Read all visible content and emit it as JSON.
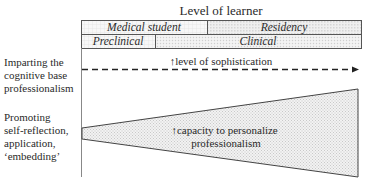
{
  "title": "Level of learner",
  "header": {
    "row1": [
      {
        "label": "Medical student"
      },
      {
        "label": "Residency"
      }
    ],
    "row2": [
      {
        "label": "Preclinical"
      },
      {
        "label": "Clinical"
      }
    ]
  },
  "rows": [
    {
      "label_lines": [
        "Imparting the",
        "cognitive base",
        "professionalism"
      ],
      "annotation": "↑level of sophistication",
      "shape": "dashed-arrow"
    },
    {
      "label_lines": [
        "Promoting",
        "self-reflection,",
        "application,",
        "‘embedding’"
      ],
      "annotation_lines": [
        "↑capacity to personalize",
        "professionalism"
      ],
      "shape": "widening-wedge"
    }
  ],
  "colors": {
    "line": "#3a3a3a",
    "text": "#2a2a2a",
    "fill_light": "#e9e9e9",
    "fill_dots": "#d8d8d8"
  }
}
